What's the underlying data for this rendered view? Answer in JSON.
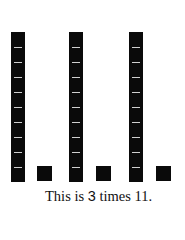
{
  "diagram": {
    "type": "base-ten-blocks",
    "groups": [
      {
        "tens": 1,
        "ones": 1,
        "rod_x": 11,
        "unit_x": 37
      },
      {
        "tens": 1,
        "ones": 1,
        "rod_x": 69,
        "unit_x": 96
      },
      {
        "tens": 1,
        "ones": 1,
        "rod_x": 129,
        "unit_x": 156
      }
    ],
    "rod_segments": 10
  },
  "caption": {
    "prefix": "This is ",
    "multiplier": "3",
    "middle": " times ",
    "number": "11",
    "suffix": "."
  }
}
